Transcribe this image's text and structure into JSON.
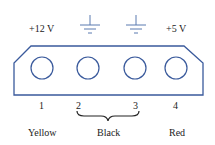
{
  "top_labels": {
    "pin1": "+12 V",
    "pin4": "+5 V"
  },
  "ground_symbols": 2,
  "pins": [
    {
      "number": "1",
      "color_label": "Yellow",
      "signal": "+12 V"
    },
    {
      "number": "2",
      "color_label": "Black",
      "signal": "ground"
    },
    {
      "number": "3",
      "color_label": "Black",
      "signal": "ground"
    },
    {
      "number": "4",
      "color_label": "Red",
      "signal": "+5 V"
    }
  ],
  "colors": {
    "outline": "#3a5a9c",
    "ground": "#5a7ab0",
    "text": "#222222"
  }
}
